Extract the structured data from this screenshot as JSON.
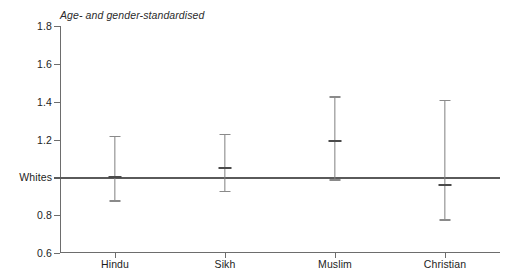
{
  "chart_data": {
    "type": "scatter",
    "title": "Age- and gender-standardised",
    "xlabel": "",
    "ylabel": "",
    "ylim": [
      0.6,
      1.8
    ],
    "ytick_values": [
      1.8,
      1.6,
      1.4,
      1.2,
      1.0,
      0.8,
      0.6
    ],
    "ytick_labels": [
      "1.8",
      "1.6",
      "1.4",
      "1.2",
      "Whites",
      "0.8",
      "0.6"
    ],
    "grid": false,
    "legend": "none",
    "reference_line": {
      "value": 1.0,
      "label": "Whites"
    },
    "categories": [
      "Hindu",
      "Sikh",
      "Muslim",
      "Christian"
    ],
    "values": [
      1.0,
      1.05,
      1.19,
      0.96
    ],
    "ci_lower": [
      0.88,
      0.93,
      0.99,
      0.78
    ],
    "ci_upper": [
      1.22,
      1.23,
      1.43,
      1.41
    ],
    "points": [
      {
        "category": "Hindu",
        "value": 1.0,
        "ci_lower": 0.88,
        "ci_upper": 1.22
      },
      {
        "category": "Sikh",
        "value": 1.05,
        "ci_lower": 0.93,
        "ci_upper": 1.23
      },
      {
        "category": "Muslim",
        "value": 1.19,
        "ci_lower": 0.99,
        "ci_upper": 1.43
      },
      {
        "category": "Christian",
        "value": 0.96,
        "ci_lower": 0.78,
        "ci_upper": 1.41
      }
    ]
  },
  "colors": {
    "axis": "#6d6d6d",
    "reference_line": "#5a5a5a",
    "errorbar": "#808080",
    "point": "#4a4a4a",
    "text": "#1d1d1d",
    "background": "#ffffff"
  }
}
